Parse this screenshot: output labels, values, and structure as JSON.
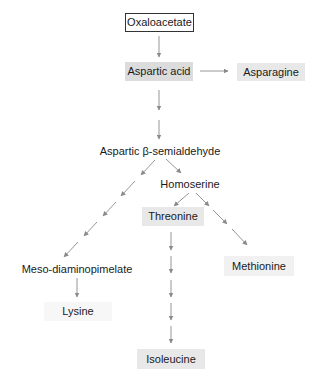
{
  "diagram": {
    "type": "metabolic-pathway",
    "nodes": {
      "oxaloacetate": "Oxaloacetate",
      "aspartic_acid": "Aspartic acid",
      "asparagine": "Asparagine",
      "aspartic_semialdehyde": "Aspartic β-semialdehyde",
      "homoserine": "Homoserine",
      "threonine": "Threonine",
      "methionine": "Methionine",
      "meso_diaminopimelate": "Meso-diaminopimelate",
      "lysine": "Lysine",
      "isoleucine": "Isoleucine"
    },
    "edges": [
      {
        "from": "Oxaloacetate",
        "to": "Aspartic acid",
        "steps": 1
      },
      {
        "from": "Aspartic acid",
        "to": "Asparagine",
        "steps": 1
      },
      {
        "from": "Aspartic acid",
        "to": "Aspartic β-semialdehyde",
        "steps": 2
      },
      {
        "from": "Aspartic β-semialdehyde",
        "to": "Homoserine",
        "steps": 1
      },
      {
        "from": "Aspartic β-semialdehyde",
        "to": "Meso-diaminopimelate",
        "steps": 5
      },
      {
        "from": "Meso-diaminopimelate",
        "to": "Lysine",
        "steps": 1
      },
      {
        "from": "Homoserine",
        "to": "Threonine",
        "steps": 1
      },
      {
        "from": "Homoserine",
        "to": "Methionine",
        "steps": 3
      },
      {
        "from": "Threonine",
        "to": "Isoleucine",
        "steps": 5
      }
    ],
    "colors": {
      "arrow": "#8a8a8a",
      "box_border": "#333333",
      "highlight_dark": "#dcdcdc",
      "highlight_mid": "#e8e8e8",
      "highlight_light": "#f1f1f1"
    }
  }
}
